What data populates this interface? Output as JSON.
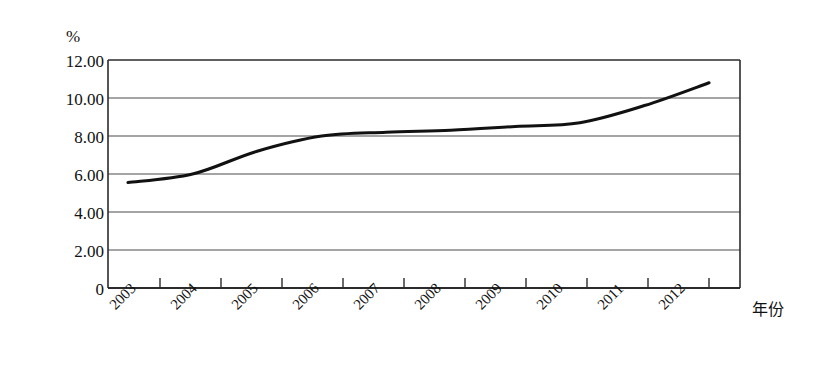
{
  "chart_data": {
    "type": "line",
    "title": "",
    "subtitle": "",
    "xlabel": "年份",
    "ylabel": "%",
    "categories": [
      "2003",
      "2004",
      "2005",
      "2006",
      "2007",
      "2008",
      "2009",
      "2010",
      "2011",
      "2012"
    ],
    "x": [
      2003,
      2004,
      2005,
      2006,
      2007,
      2008,
      2009,
      2010,
      2011,
      2012
    ],
    "values": [
      5.55,
      6.0,
      7.2,
      8.0,
      8.2,
      8.3,
      8.5,
      8.7,
      9.6,
      10.8
    ],
    "series": [
      {
        "name": "",
        "values": [
          5.55,
          6.0,
          7.2,
          8.0,
          8.2,
          8.3,
          8.5,
          8.7,
          9.6,
          10.8
        ]
      }
    ],
    "ylim": [
      0,
      12
    ],
    "xlim": [
      2003,
      2012
    ],
    "ytick_labels": [
      "12.00",
      "10.00",
      "8.00",
      "6.00",
      "4.00",
      "2.00",
      "0"
    ],
    "ytick_values": [
      12,
      10,
      8,
      6,
      4,
      2,
      0
    ],
    "xtick_labels": [
      "2003",
      "2004",
      "2005",
      "2006",
      "2007",
      "2008",
      "2009",
      "2010",
      "2011",
      "2012"
    ],
    "grid": true,
    "grid_axis": "y",
    "legend": "none",
    "legend_position": "none",
    "annotations": [],
    "line_color": "#111111",
    "grid_color": "#555555",
    "axis_color": "#333333",
    "background_color": "#ffffff",
    "xtick_label_rotation": -45,
    "markers": "none"
  },
  "axis_labels": {
    "y_unit": "%",
    "x_title": "年份"
  }
}
